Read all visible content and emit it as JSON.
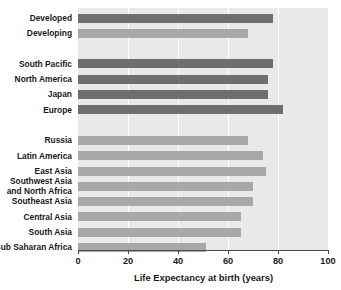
{
  "chart_data": {
    "type": "bar",
    "orientation": "horizontal",
    "title": "",
    "xlabel": "Life Expectancy at birth (years)",
    "ylabel": "",
    "xlim": [
      0,
      100
    ],
    "xticks": [
      0,
      20,
      40,
      60,
      80,
      100
    ],
    "grid": true,
    "gridlines_axis": "x",
    "legend": null,
    "plot_background": "#e9e9e9",
    "series_colors": {
      "dark": "#6e6e6e",
      "light": "#a8a8a8"
    },
    "groups": [
      {
        "name": "World aggregates",
        "items": [
          {
            "label": "Developed",
            "value": 78,
            "color": "dark"
          },
          {
            "label": "Developing",
            "value": 68,
            "color": "light"
          }
        ]
      },
      {
        "name": "Developed regions",
        "items": [
          {
            "label": "South Pacific",
            "value": 78,
            "color": "dark"
          },
          {
            "label": "North America",
            "value": 76,
            "color": "dark"
          },
          {
            "label": "Japan",
            "value": 76,
            "color": "dark"
          },
          {
            "label": "Europe",
            "value": 82,
            "color": "dark"
          }
        ]
      },
      {
        "name": "Developing regions",
        "items": [
          {
            "label": "Russia",
            "value": 68,
            "color": "light"
          },
          {
            "label": "Latin America",
            "value": 74,
            "color": "light"
          },
          {
            "label": "East Asia",
            "value": 75,
            "color": "light"
          },
          {
            "label": "Southwest Asia and North Africa",
            "value": 70,
            "color": "light"
          },
          {
            "label": "Southeast Asia",
            "value": 70,
            "color": "light"
          },
          {
            "label": "Central Asia",
            "value": 65,
            "color": "light"
          },
          {
            "label": "South Asia",
            "value": 65,
            "color": "light"
          },
          {
            "label": "Sub Saharan Africa",
            "value": 51,
            "color": "light"
          }
        ]
      }
    ],
    "categories": [
      "Developed",
      "Developing",
      "South Pacific",
      "North America",
      "Japan",
      "Europe",
      "Russia",
      "Latin America",
      "East Asia",
      "Southwest Asia and North Africa",
      "Southeast Asia",
      "Central Asia",
      "South Asia",
      "Sub Saharan Africa"
    ],
    "values": [
      78,
      68,
      78,
      76,
      76,
      82,
      68,
      74,
      75,
      70,
      70,
      65,
      65,
      51
    ]
  },
  "axis": {
    "tick_labels": [
      "0",
      "20",
      "40",
      "60",
      "80",
      "100"
    ],
    "title": "Life Expectancy at birth (years)"
  },
  "labels": {
    "developed": "Developed",
    "developing": "Developing",
    "south_pacific": "South Pacific",
    "north_america": "North America",
    "japan": "Japan",
    "europe": "Europe",
    "russia": "Russia",
    "latin_america": "Latin America",
    "east_asia": "East Asia",
    "southwest_asia_line1": "Southwest Asia",
    "southwest_asia_line2": "and North Africa",
    "southeast_asia": "Southeast Asia",
    "central_asia": "Central Asia",
    "south_asia": "South Asia",
    "sub_saharan_africa": "Sub Saharan Africa"
  }
}
